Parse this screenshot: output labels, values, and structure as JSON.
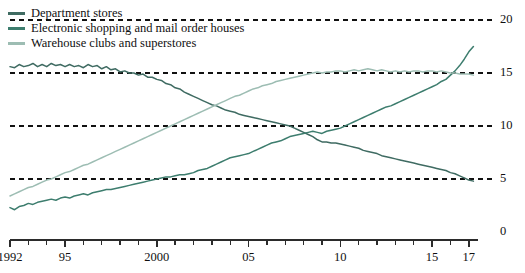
{
  "chart_data": {
    "type": "line",
    "title": "",
    "subtitle": "",
    "xlabel": "",
    "ylabel": "",
    "xlim": [
      1992,
      2017.5
    ],
    "ylim": [
      0,
      20
    ],
    "yticks": [
      0,
      5,
      10,
      15,
      20
    ],
    "ytick_labels": [
      "0",
      "5",
      "10",
      "15",
      "20"
    ],
    "xticks": [
      1992,
      1993,
      1994,
      1995,
      1996,
      1997,
      1998,
      1999,
      2000,
      2001,
      2002,
      2003,
      2004,
      2005,
      2006,
      2007,
      2008,
      2009,
      2010,
      2011,
      2012,
      2013,
      2014,
      2015,
      2016,
      2017
    ],
    "xtick_labels": [
      "1992",
      "",
      "",
      "95",
      "",
      "",
      "",
      "",
      "2000",
      "",
      "",
      "",
      "",
      "05",
      "",
      "",
      "",
      "",
      "10",
      "",
      "",
      "",
      "",
      "15",
      "",
      "17"
    ],
    "labeled_xticks": [
      {
        "x": 1992,
        "label": "1992"
      },
      {
        "x": 1995,
        "label": "95"
      },
      {
        "x": 2000,
        "label": "2000"
      },
      {
        "x": 2005,
        "label": "05"
      },
      {
        "x": 2010,
        "label": "10"
      },
      {
        "x": 2015,
        "label": "15"
      },
      {
        "x": 2017,
        "label": "17"
      }
    ],
    "grid": "horizontal-dashed",
    "legend_position": "top-left",
    "series": [
      {
        "name": "Department stores",
        "color": "#3f6b62",
        "x": [
          1992.0,
          1992.25,
          1992.5,
          1992.75,
          1993.0,
          1993.25,
          1993.5,
          1993.75,
          1994.0,
          1994.25,
          1994.5,
          1994.75,
          1995.0,
          1995.25,
          1995.5,
          1995.75,
          1996.0,
          1996.25,
          1996.5,
          1996.75,
          1997.0,
          1997.25,
          1997.5,
          1997.75,
          1998.0,
          1998.25,
          1998.5,
          1998.75,
          1999.0,
          1999.25,
          1999.5,
          1999.75,
          2000.0,
          2000.25,
          2000.5,
          2000.75,
          2001.0,
          2001.25,
          2001.5,
          2001.75,
          2002.0,
          2002.25,
          2002.5,
          2002.75,
          2003.0,
          2003.25,
          2003.5,
          2003.75,
          2004.0,
          2004.25,
          2004.5,
          2004.75,
          2005.0,
          2005.25,
          2005.5,
          2005.75,
          2006.0,
          2006.25,
          2006.5,
          2006.75,
          2007.0,
          2007.25,
          2007.5,
          2007.75,
          2008.0,
          2008.25,
          2008.5,
          2008.75,
          2009.0,
          2009.25,
          2009.5,
          2009.75,
          2010.0,
          2010.25,
          2010.5,
          2010.75,
          2011.0,
          2011.25,
          2011.5,
          2011.75,
          2012.0,
          2012.25,
          2012.5,
          2012.75,
          2013.0,
          2013.25,
          2013.5,
          2013.75,
          2014.0,
          2014.25,
          2014.5,
          2014.75,
          2015.0,
          2015.25,
          2015.5,
          2015.75,
          2016.0,
          2016.25,
          2016.5,
          2016.75,
          2017.0,
          2017.25
        ],
        "y": [
          15.6,
          15.5,
          15.8,
          15.6,
          15.7,
          15.9,
          15.6,
          15.8,
          15.6,
          15.9,
          15.7,
          15.8,
          15.6,
          15.8,
          15.6,
          15.7,
          15.5,
          15.8,
          15.6,
          15.7,
          15.4,
          15.6,
          15.3,
          15.4,
          15.1,
          15.2,
          15.0,
          15.0,
          14.8,
          14.9,
          14.6,
          14.6,
          14.4,
          14.3,
          14.0,
          13.9,
          13.6,
          13.5,
          13.2,
          13.0,
          12.8,
          12.6,
          12.4,
          12.2,
          12.0,
          11.9,
          11.7,
          11.5,
          11.4,
          11.3,
          11.1,
          11.0,
          10.9,
          10.8,
          10.7,
          10.6,
          10.5,
          10.4,
          10.3,
          10.2,
          10.1,
          10.0,
          9.8,
          9.6,
          9.4,
          9.2,
          9.0,
          8.7,
          8.5,
          8.5,
          8.4,
          8.4,
          8.3,
          8.2,
          8.1,
          8.0,
          7.9,
          7.7,
          7.6,
          7.5,
          7.4,
          7.2,
          7.1,
          7.0,
          6.9,
          6.8,
          6.7,
          6.6,
          6.5,
          6.4,
          6.3,
          6.2,
          6.1,
          6.0,
          5.9,
          5.8,
          5.6,
          5.5,
          5.3,
          5.1,
          4.9,
          4.8
        ]
      },
      {
        "name": "Electronic shopping and mail order houses",
        "color": "#3d7d6e",
        "x": [
          1992.0,
          1992.25,
          1992.5,
          1992.75,
          1993.0,
          1993.25,
          1993.5,
          1993.75,
          1994.0,
          1994.25,
          1994.5,
          1994.75,
          1995.0,
          1995.25,
          1995.5,
          1995.75,
          1996.0,
          1996.25,
          1996.5,
          1996.75,
          1997.0,
          1997.25,
          1997.5,
          1997.75,
          1998.0,
          1998.25,
          1998.5,
          1998.75,
          1999.0,
          1999.25,
          1999.5,
          1999.75,
          2000.0,
          2000.25,
          2000.5,
          2000.75,
          2001.0,
          2001.25,
          2001.5,
          2001.75,
          2002.0,
          2002.25,
          2002.5,
          2002.75,
          2003.0,
          2003.25,
          2003.5,
          2003.75,
          2004.0,
          2004.25,
          2004.5,
          2004.75,
          2005.0,
          2005.25,
          2005.5,
          2005.75,
          2006.0,
          2006.25,
          2006.5,
          2006.75,
          2007.0,
          2007.25,
          2007.5,
          2007.75,
          2008.0,
          2008.25,
          2008.5,
          2008.75,
          2009.0,
          2009.25,
          2009.5,
          2009.75,
          2010.0,
          2010.25,
          2010.5,
          2010.75,
          2011.0,
          2011.25,
          2011.5,
          2011.75,
          2012.0,
          2012.25,
          2012.5,
          2012.75,
          2013.0,
          2013.25,
          2013.5,
          2013.75,
          2014.0,
          2014.25,
          2014.5,
          2014.75,
          2015.0,
          2015.25,
          2015.5,
          2015.75,
          2016.0,
          2016.25,
          2016.5,
          2016.75,
          2017.0,
          2017.25
        ],
        "y": [
          2.3,
          2.1,
          2.4,
          2.5,
          2.7,
          2.6,
          2.8,
          2.9,
          3.0,
          3.1,
          3.0,
          3.2,
          3.3,
          3.2,
          3.4,
          3.5,
          3.6,
          3.5,
          3.7,
          3.8,
          3.9,
          4.0,
          4.0,
          4.1,
          4.2,
          4.3,
          4.4,
          4.5,
          4.6,
          4.7,
          4.8,
          4.9,
          5.0,
          5.1,
          5.2,
          5.2,
          5.3,
          5.4,
          5.4,
          5.5,
          5.6,
          5.8,
          5.9,
          6.0,
          6.2,
          6.4,
          6.6,
          6.8,
          7.0,
          7.1,
          7.2,
          7.3,
          7.4,
          7.6,
          7.8,
          8.0,
          8.2,
          8.4,
          8.5,
          8.6,
          8.8,
          9.0,
          9.1,
          9.2,
          9.3,
          9.4,
          9.5,
          9.4,
          9.3,
          9.5,
          9.6,
          9.7,
          9.8,
          10.0,
          10.2,
          10.4,
          10.6,
          10.8,
          11.0,
          11.2,
          11.4,
          11.6,
          11.8,
          11.9,
          12.1,
          12.3,
          12.5,
          12.7,
          12.9,
          13.1,
          13.3,
          13.5,
          13.7,
          13.9,
          14.2,
          14.4,
          14.8,
          15.2,
          15.7,
          16.3,
          17.0,
          17.5
        ]
      },
      {
        "name": "Warehouse clubs and superstores",
        "color": "#9dbdb3",
        "x": [
          1992.0,
          1992.25,
          1992.5,
          1992.75,
          1993.0,
          1993.25,
          1993.5,
          1993.75,
          1994.0,
          1994.25,
          1994.5,
          1994.75,
          1995.0,
          1995.25,
          1995.5,
          1995.75,
          1996.0,
          1996.25,
          1996.5,
          1996.75,
          1997.0,
          1997.25,
          1997.5,
          1997.75,
          1998.0,
          1998.25,
          1998.5,
          1998.75,
          1999.0,
          1999.25,
          1999.5,
          1999.75,
          2000.0,
          2000.25,
          2000.5,
          2000.75,
          2001.0,
          2001.25,
          2001.5,
          2001.75,
          2002.0,
          2002.25,
          2002.5,
          2002.75,
          2003.0,
          2003.25,
          2003.5,
          2003.75,
          2004.0,
          2004.25,
          2004.5,
          2004.75,
          2005.0,
          2005.25,
          2005.5,
          2005.75,
          2006.0,
          2006.25,
          2006.5,
          2006.75,
          2007.0,
          2007.25,
          2007.5,
          2007.75,
          2008.0,
          2008.25,
          2008.5,
          2008.75,
          2009.0,
          2009.25,
          2009.5,
          2009.75,
          2010.0,
          2010.25,
          2010.5,
          2010.75,
          2011.0,
          2011.25,
          2011.5,
          2011.75,
          2012.0,
          2012.25,
          2012.5,
          2012.75,
          2013.0,
          2013.25,
          2013.5,
          2013.75,
          2014.0,
          2014.25,
          2014.5,
          2014.75,
          2015.0,
          2015.25,
          2015.5,
          2015.75,
          2016.0,
          2016.25,
          2016.5,
          2016.75,
          2017.0,
          2017.25
        ],
        "y": [
          3.4,
          3.6,
          3.8,
          4.0,
          4.2,
          4.3,
          4.5,
          4.7,
          4.9,
          5.0,
          5.2,
          5.4,
          5.6,
          5.7,
          5.9,
          6.1,
          6.3,
          6.4,
          6.6,
          6.8,
          7.0,
          7.2,
          7.4,
          7.6,
          7.8,
          8.0,
          8.2,
          8.4,
          8.6,
          8.8,
          9.0,
          9.2,
          9.4,
          9.6,
          9.8,
          10.0,
          10.2,
          10.4,
          10.6,
          10.8,
          11.0,
          11.2,
          11.4,
          11.6,
          11.8,
          12.0,
          12.2,
          12.4,
          12.6,
          12.8,
          12.9,
          13.1,
          13.3,
          13.5,
          13.6,
          13.8,
          13.9,
          14.0,
          14.2,
          14.3,
          14.4,
          14.5,
          14.6,
          14.7,
          14.8,
          14.9,
          15.0,
          15.1,
          15.0,
          15.1,
          15.1,
          15.2,
          15.2,
          15.1,
          15.2,
          15.3,
          15.2,
          15.3,
          15.4,
          15.3,
          15.2,
          15.3,
          15.2,
          15.1,
          15.2,
          15.1,
          15.2,
          15.1,
          15.2,
          15.2,
          15.1,
          15.2,
          15.2,
          15.1,
          15.2,
          15.1,
          15.0,
          15.0,
          14.9,
          14.9,
          14.9,
          14.8
        ]
      }
    ]
  },
  "legend": {
    "items": [
      {
        "label": "Department stores",
        "color": "#3f6b62"
      },
      {
        "label": "Electronic shopping and mail order houses",
        "color": "#3d7d6e"
      },
      {
        "label": "Warehouse clubs and superstores",
        "color": "#9dbdb3"
      }
    ]
  },
  "axis": {
    "y_labels": [
      "20",
      "15",
      "10",
      "5",
      "0"
    ],
    "x_labels": [
      "1992",
      "95",
      "2000",
      "05",
      "10",
      "15",
      "17"
    ]
  }
}
